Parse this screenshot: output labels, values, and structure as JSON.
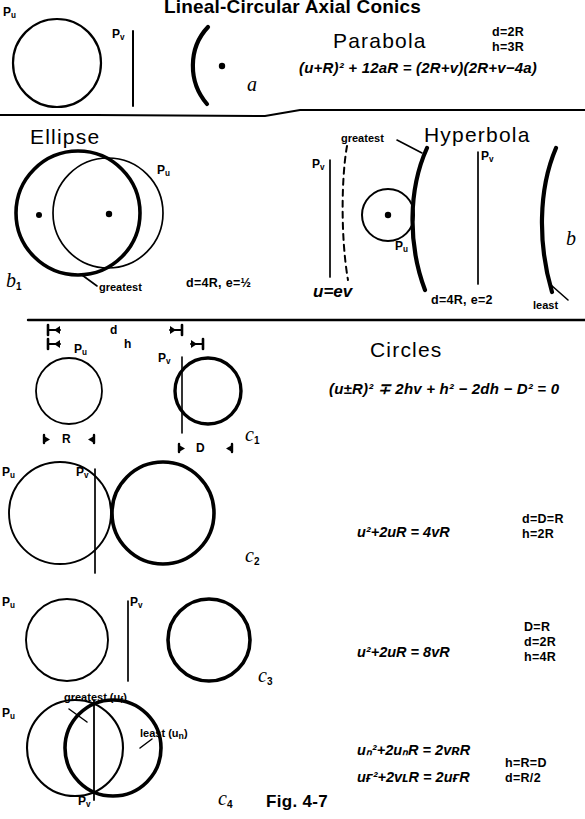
{
  "figure": {
    "title": "Lineal-Circular Axial Conics",
    "caption": "Fig. 4-7"
  },
  "sections": {
    "parabola": {
      "name": "Parabola",
      "case_label": "a",
      "equation": "(u+R)² + 12aR = (2R+v)(2R+v−4a)",
      "equation_parts": {
        "lhs_base": "(u+R)",
        "lhs_exp": "2",
        "rest": "+ 12aR = (2R+v)(2R+v−4a)"
      },
      "conditions": [
        "d=2R",
        "h=3R"
      ],
      "pu_label": "P",
      "pu_sub": "u",
      "pv_label": "P",
      "pv_sub": "v"
    },
    "ellipse": {
      "name": "Ellipse",
      "case_label": "b",
      "case_sub": "1",
      "conditions": [
        "d=4R, e=½"
      ],
      "annotations": [
        "greatest"
      ],
      "pu_label": "P",
      "pu_sub": "u"
    },
    "hyperbola": {
      "name": "Hyperbola",
      "case_label": "b",
      "conditions": [
        "d=4R, e=2"
      ],
      "annotations": [
        "greatest",
        "least"
      ],
      "relation": "u=ev",
      "pu_label": "P",
      "pu_sub": "u",
      "pv_label": "P",
      "pv_sub": "v"
    },
    "circles": {
      "name": "Circles",
      "general_equation": "(u±R)² ∓ 2hv + h² − 2dh − D² = 0",
      "dimension_labels": [
        "d",
        "h"
      ],
      "rows": [
        {
          "case_label": "c",
          "case_sub": "1",
          "equation": "",
          "conditions": [],
          "measures": [
            "R",
            "D"
          ],
          "pu_label": "P",
          "pu_sub": "u",
          "pv_label": "P",
          "pv_sub": "v"
        },
        {
          "case_label": "c",
          "case_sub": "2",
          "equation": "u²+2uR = 4vR",
          "conditions": [
            "d=D=R",
            "h=2R"
          ],
          "pu_label": "P",
          "pu_sub": "u",
          "pv_label": "P",
          "pv_sub": "v"
        },
        {
          "case_label": "c",
          "case_sub": "3",
          "equation": "u²+2uR = 8vR",
          "conditions": [
            "D=R",
            "d=2R",
            "h=4R"
          ],
          "pu_label": "P",
          "pu_sub": "u",
          "pv_label": "P",
          "pv_sub": "v"
        },
        {
          "case_label": "c",
          "case_sub": "4",
          "equations": [
            "uₙ²+2uₙR = 2vʀR",
            "uғ²+2vʟR = 2uғR"
          ],
          "conditions": [
            "h=R=D",
            "d=R/2"
          ],
          "annotations": [
            "greatest (u",
            "least (u"
          ],
          "annotation_full": [
            "greatest (u_f)",
            "least (u_n)"
          ],
          "pu_label": "P",
          "pu_sub": "u",
          "pv_label": "P",
          "pv_sub": "v"
        }
      ]
    }
  },
  "colors": {
    "ink": "#000000",
    "paper": "#ffffff"
  }
}
